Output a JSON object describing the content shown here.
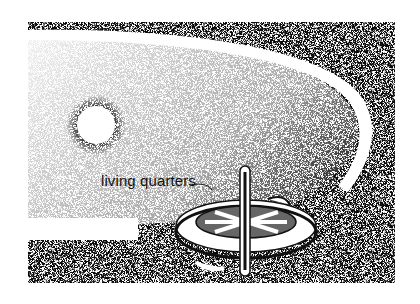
{
  "illustration": {
    "label": "living quarters",
    "colors": {
      "ink": "#1a1a1a",
      "paper": "#ffffff"
    }
  }
}
